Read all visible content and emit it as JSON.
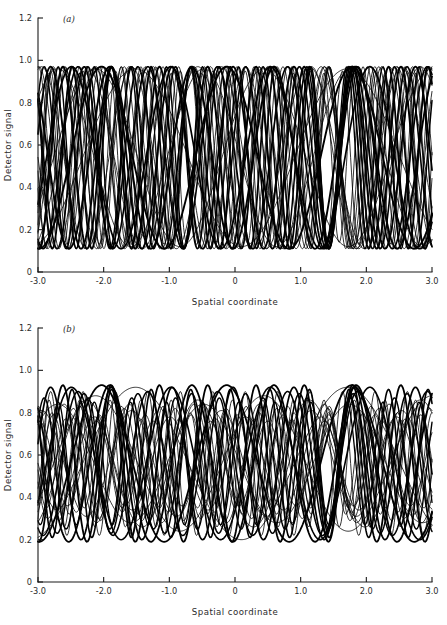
{
  "figure": {
    "panels": [
      {
        "id": "a",
        "label": "(a)",
        "xlabel": "Spatial coordinate",
        "ylabel": "Detector signal"
      },
      {
        "id": "b",
        "label": "(b)",
        "xlabel": "Spatial coordinate",
        "ylabel": "Detector signal"
      }
    ],
    "xticklabels": [
      "-3.0",
      "-2.0",
      "-1.0",
      "0",
      "1.0",
      "2.0",
      "3.0"
    ],
    "yticklabels": [
      "0",
      "0.2",
      "0.4",
      "0.6",
      "0.8",
      "1.0",
      "1.2"
    ]
  },
  "chart_data": [
    {
      "type": "line",
      "panel": "a",
      "title": "(a)",
      "xlabel": "Spatial coordinate",
      "ylabel": "Detector signal",
      "xlim": [
        -3.0,
        3.0
      ],
      "ylim": [
        0,
        1.2
      ],
      "xticks": [
        -3.0,
        -2.0,
        -1.0,
        0,
        1.0,
        2.0,
        3.0
      ],
      "yticks": [
        0,
        0.2,
        0.4,
        0.6,
        0.8,
        1.0,
        1.2
      ],
      "grid": false,
      "legend": "none",
      "description": "Overlay of many sinusoidal interference fringe traces of differing spatial frequency and phase, all confined to a high-visibility envelope between about 0.11 and 0.97 in detector signal.",
      "envelope": {
        "min": 0.11,
        "max": 0.97,
        "mean": 0.54,
        "amplitude": 0.43,
        "visibility": 0.8
      },
      "series": [
        {
          "name": "trace-1",
          "frequency": 1.05,
          "phase": 0.42,
          "offset": 0.54,
          "amplitude": 0.43,
          "linewidth": 1.9
        },
        {
          "name": "trace-2",
          "frequency": 1.18,
          "phase": 2.1,
          "offset": 0.54,
          "amplitude": 0.43,
          "linewidth": 0.8
        },
        {
          "name": "trace-3",
          "frequency": 1.32,
          "phase": 4.05,
          "offset": 0.54,
          "amplitude": 0.43,
          "linewidth": 1.7
        },
        {
          "name": "trace-4",
          "frequency": 1.46,
          "phase": 0.95,
          "offset": 0.54,
          "amplitude": 0.43,
          "linewidth": 0.8
        },
        {
          "name": "trace-5",
          "frequency": 1.6,
          "phase": 3.3,
          "offset": 0.54,
          "amplitude": 0.43,
          "linewidth": 1.9
        },
        {
          "name": "trace-6",
          "frequency": 1.74,
          "phase": 5.4,
          "offset": 0.54,
          "amplitude": 0.43,
          "linewidth": 0.8
        },
        {
          "name": "trace-7",
          "frequency": 1.88,
          "phase": 1.55,
          "offset": 0.54,
          "amplitude": 0.43,
          "linewidth": 1.6
        },
        {
          "name": "trace-8",
          "frequency": 2.02,
          "phase": 3.95,
          "offset": 0.54,
          "amplitude": 0.43,
          "linewidth": 0.8
        },
        {
          "name": "trace-9",
          "frequency": 2.16,
          "phase": 0.2,
          "offset": 0.54,
          "amplitude": 0.43,
          "linewidth": 1.8
        },
        {
          "name": "trace-10",
          "frequency": 2.3,
          "phase": 2.7,
          "offset": 0.54,
          "amplitude": 0.43,
          "linewidth": 0.8
        },
        {
          "name": "trace-11",
          "frequency": 2.44,
          "phase": 5.05,
          "offset": 0.54,
          "amplitude": 0.43,
          "linewidth": 1.6
        },
        {
          "name": "trace-12",
          "frequency": 2.58,
          "phase": 1.1,
          "offset": 0.54,
          "amplitude": 0.43,
          "linewidth": 0.8
        },
        {
          "name": "trace-13",
          "frequency": 2.72,
          "phase": 3.55,
          "offset": 0.54,
          "amplitude": 0.43,
          "linewidth": 1.9
        },
        {
          "name": "trace-14",
          "frequency": 2.86,
          "phase": 6.0,
          "offset": 0.54,
          "amplitude": 0.43,
          "linewidth": 0.8
        },
        {
          "name": "trace-15",
          "frequency": 3.0,
          "phase": 2.25,
          "offset": 0.54,
          "amplitude": 0.43,
          "linewidth": 1.5
        },
        {
          "name": "trace-16",
          "frequency": 3.16,
          "phase": 4.6,
          "offset": 0.54,
          "amplitude": 0.43,
          "linewidth": 0.8
        },
        {
          "name": "trace-17",
          "frequency": 3.32,
          "phase": 0.75,
          "offset": 0.54,
          "amplitude": 0.43,
          "linewidth": 1.8
        },
        {
          "name": "trace-18",
          "frequency": 3.48,
          "phase": 3.1,
          "offset": 0.54,
          "amplitude": 0.43,
          "linewidth": 0.8
        },
        {
          "name": "trace-19",
          "frequency": 3.64,
          "phase": 5.65,
          "offset": 0.54,
          "amplitude": 0.43,
          "linewidth": 1.4
        },
        {
          "name": "trace-20",
          "frequency": 3.8,
          "phase": 1.85,
          "offset": 0.54,
          "amplitude": 0.43,
          "linewidth": 0.8
        },
        {
          "name": "trace-21",
          "frequency": 0.62,
          "phase": 2.95,
          "offset": 0.54,
          "amplitude": 0.42,
          "linewidth": 0.8
        },
        {
          "name": "trace-22",
          "frequency": 0.78,
          "phase": 5.2,
          "offset": 0.54,
          "amplitude": 0.42,
          "linewidth": 0.8
        },
        {
          "name": "trace-23",
          "frequency": 0.9,
          "phase": 1.35,
          "offset": 0.54,
          "amplitude": 0.42,
          "linewidth": 0.8
        },
        {
          "name": "trace-24",
          "frequency": 4.05,
          "phase": 4.3,
          "offset": 0.54,
          "amplitude": 0.41,
          "linewidth": 0.8
        },
        {
          "name": "trace-25",
          "frequency": 4.3,
          "phase": 0.55,
          "offset": 0.54,
          "amplitude": 0.4,
          "linewidth": 0.8
        }
      ]
    },
    {
      "type": "line",
      "panel": "b",
      "title": "(b)",
      "xlabel": "Spatial coordinate",
      "ylabel": "Detector signal",
      "xlim": [
        -3.0,
        3.0
      ],
      "ylim": [
        0,
        1.2
      ],
      "xticks": [
        -3.0,
        -2.0,
        -1.0,
        0,
        1.0,
        2.0,
        3.0
      ],
      "yticks": [
        0,
        0.2,
        0.4,
        0.6,
        0.8,
        1.0,
        1.2
      ],
      "grid": false,
      "legend": "none",
      "description": "Same family of sinusoidal fringe traces but with reduced fringe visibility; the traces occupy a narrower envelope between about 0.19 and 0.93 and individual curve amplitudes vary more widely.",
      "envelope": {
        "min": 0.19,
        "max": 0.93,
        "mean": 0.56,
        "amplitude": 0.37,
        "visibility": 0.66
      },
      "series": [
        {
          "name": "trace-1",
          "frequency": 1.05,
          "phase": 0.42,
          "offset": 0.56,
          "amplitude": 0.37,
          "linewidth": 1.8
        },
        {
          "name": "trace-2",
          "frequency": 1.18,
          "phase": 2.1,
          "offset": 0.56,
          "amplitude": 0.3,
          "linewidth": 0.8
        },
        {
          "name": "trace-3",
          "frequency": 1.32,
          "phase": 4.05,
          "offset": 0.56,
          "amplitude": 0.36,
          "linewidth": 1.6
        },
        {
          "name": "trace-4",
          "frequency": 1.46,
          "phase": 0.95,
          "offset": 0.56,
          "amplitude": 0.25,
          "linewidth": 0.8
        },
        {
          "name": "trace-5",
          "frequency": 1.6,
          "phase": 3.3,
          "offset": 0.56,
          "amplitude": 0.37,
          "linewidth": 1.8
        },
        {
          "name": "trace-6",
          "frequency": 1.74,
          "phase": 5.4,
          "offset": 0.56,
          "amplitude": 0.22,
          "linewidth": 0.8
        },
        {
          "name": "trace-7",
          "frequency": 1.88,
          "phase": 1.55,
          "offset": 0.56,
          "amplitude": 0.34,
          "linewidth": 1.5
        },
        {
          "name": "trace-8",
          "frequency": 2.02,
          "phase": 3.95,
          "offset": 0.56,
          "amplitude": 0.28,
          "linewidth": 0.8
        },
        {
          "name": "trace-9",
          "frequency": 2.16,
          "phase": 0.2,
          "offset": 0.56,
          "amplitude": 0.36,
          "linewidth": 1.7
        },
        {
          "name": "trace-10",
          "frequency": 2.3,
          "phase": 2.7,
          "offset": 0.56,
          "amplitude": 0.2,
          "linewidth": 0.8
        },
        {
          "name": "trace-11",
          "frequency": 2.44,
          "phase": 5.05,
          "offset": 0.56,
          "amplitude": 0.33,
          "linewidth": 1.5
        },
        {
          "name": "trace-12",
          "frequency": 2.58,
          "phase": 1.1,
          "offset": 0.56,
          "amplitude": 0.26,
          "linewidth": 0.8
        },
        {
          "name": "trace-13",
          "frequency": 2.72,
          "phase": 3.55,
          "offset": 0.56,
          "amplitude": 0.37,
          "linewidth": 1.8
        },
        {
          "name": "trace-14",
          "frequency": 2.86,
          "phase": 6.0,
          "offset": 0.56,
          "amplitude": 0.23,
          "linewidth": 0.8
        },
        {
          "name": "trace-15",
          "frequency": 3.0,
          "phase": 2.25,
          "offset": 0.56,
          "amplitude": 0.31,
          "linewidth": 1.4
        },
        {
          "name": "trace-16",
          "frequency": 3.16,
          "phase": 4.6,
          "offset": 0.56,
          "amplitude": 0.27,
          "linewidth": 0.8
        },
        {
          "name": "trace-17",
          "frequency": 3.32,
          "phase": 0.75,
          "offset": 0.56,
          "amplitude": 0.35,
          "linewidth": 1.6
        },
        {
          "name": "trace-18",
          "frequency": 3.48,
          "phase": 3.1,
          "offset": 0.56,
          "amplitude": 0.21,
          "linewidth": 0.8
        },
        {
          "name": "trace-19",
          "frequency": 3.64,
          "phase": 5.65,
          "offset": 0.56,
          "amplitude": 0.29,
          "linewidth": 1.3
        },
        {
          "name": "trace-20",
          "frequency": 3.8,
          "phase": 1.85,
          "offset": 0.56,
          "amplitude": 0.24,
          "linewidth": 0.8
        },
        {
          "name": "trace-21",
          "frequency": 0.62,
          "phase": 2.95,
          "offset": 0.56,
          "amplitude": 0.36,
          "linewidth": 0.8
        },
        {
          "name": "trace-22",
          "frequency": 0.78,
          "phase": 5.2,
          "offset": 0.56,
          "amplitude": 0.32,
          "linewidth": 0.8
        },
        {
          "name": "trace-23",
          "frequency": 0.9,
          "phase": 1.35,
          "offset": 0.56,
          "amplitude": 0.28,
          "linewidth": 0.8
        },
        {
          "name": "trace-24",
          "frequency": 4.05,
          "phase": 4.3,
          "offset": 0.56,
          "amplitude": 0.34,
          "linewidth": 0.8
        },
        {
          "name": "trace-25",
          "frequency": 4.3,
          "phase": 0.55,
          "offset": 0.56,
          "amplitude": 0.3,
          "linewidth": 0.8
        }
      ]
    }
  ]
}
